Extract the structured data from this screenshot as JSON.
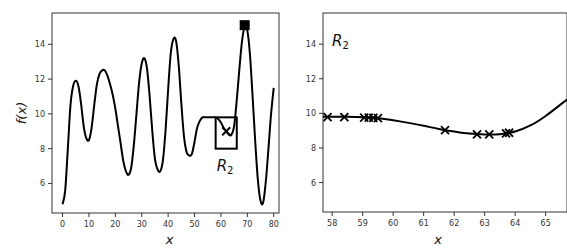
{
  "chart_data": [
    {
      "type": "line",
      "title": "",
      "xlabel": "x",
      "ylabel": "f(x)",
      "xlim": [
        -4,
        82
      ],
      "ylim": [
        4.3,
        15.8
      ],
      "xticks": [
        0,
        10,
        20,
        30,
        40,
        50,
        60,
        70,
        80
      ],
      "yticks": [
        6,
        8,
        10,
        12,
        14
      ],
      "grid": false,
      "series": [
        {
          "name": "f(x)",
          "x": [
            0,
            1,
            2,
            3,
            4,
            5,
            6,
            7,
            8,
            9,
            10,
            11,
            12,
            13,
            14,
            15,
            16,
            17,
            18,
            19,
            20,
            21,
            22,
            23,
            24,
            25,
            26,
            27,
            28,
            29,
            30,
            31,
            32,
            33,
            34,
            35,
            36,
            37,
            38,
            39,
            40,
            41,
            42,
            43,
            44,
            45,
            46,
            47,
            48,
            49,
            50,
            51,
            52,
            53,
            54,
            55,
            56,
            57,
            58,
            59,
            60,
            61,
            62,
            63,
            64,
            65,
            66,
            67,
            68,
            69,
            70,
            71,
            72,
            73,
            74,
            75,
            76,
            77,
            78,
            79,
            80
          ],
          "y": [
            4.8,
            5.6,
            8.0,
            10.5,
            11.6,
            11.9,
            11.6,
            10.6,
            9.3,
            8.6,
            8.5,
            9.2,
            10.5,
            11.7,
            12.3,
            12.5,
            12.5,
            12.2,
            11.7,
            11.1,
            10.3,
            9.3,
            8.3,
            7.3,
            6.7,
            6.5,
            6.9,
            8.2,
            10.0,
            11.8,
            12.9,
            13.2,
            12.6,
            11.0,
            9.0,
            7.4,
            6.8,
            6.7,
            7.3,
            9.0,
            11.4,
            13.5,
            14.3,
            14.2,
            12.8,
            10.6,
            8.7,
            7.8,
            7.6,
            7.7,
            8.4,
            9.2,
            9.6,
            9.8,
            9.8,
            9.8,
            9.8,
            9.8,
            9.8,
            9.7,
            9.5,
            9.2,
            9.0,
            8.8,
            8.8,
            9.3,
            10.8,
            12.6,
            14.2,
            15.0,
            14.8,
            13.4,
            11.0,
            8.4,
            6.2,
            5.0,
            4.9,
            6.1,
            8.0,
            10.0,
            11.5
          ]
        }
      ],
      "annotations": [
        {
          "type": "square-marker",
          "x": 69,
          "y": 15.1,
          "label": "maximum"
        },
        {
          "type": "x-marker",
          "x": 62,
          "y": 9.0
        },
        {
          "type": "rectangle",
          "x_range": [
            58,
            66
          ],
          "y_range": [
            8.0,
            9.8
          ],
          "label": "R2"
        }
      ]
    },
    {
      "type": "line",
      "title": "",
      "xlabel": "x",
      "ylabel": "",
      "xlim": [
        57.7,
        65.7
      ],
      "ylim": [
        4.3,
        15.8
      ],
      "xticks": [
        58,
        59,
        60,
        61,
        62,
        63,
        64,
        65
      ],
      "yticks": [
        6,
        8,
        10,
        12,
        14
      ],
      "grid": false,
      "region_label": "R2",
      "series": [
        {
          "name": "f(x)",
          "x": [
            57.7,
            58.0,
            58.5,
            59.0,
            59.5,
            60.0,
            60.5,
            61.0,
            61.5,
            62.0,
            62.5,
            63.0,
            63.5,
            64.0,
            64.5,
            65.0,
            65.7
          ],
          "y": [
            9.8,
            9.8,
            9.8,
            9.78,
            9.72,
            9.6,
            9.45,
            9.28,
            9.1,
            8.95,
            8.83,
            8.78,
            8.8,
            8.95,
            9.3,
            9.85,
            10.8
          ]
        },
        {
          "name": "samples",
          "marker": "x",
          "x": [
            57.85,
            58.4,
            59.05,
            59.2,
            59.35,
            59.5,
            61.7,
            62.75,
            63.15,
            63.7,
            63.8
          ],
          "y": [
            9.78,
            9.78,
            9.76,
            9.75,
            9.74,
            9.72,
            9.03,
            8.78,
            8.78,
            8.85,
            8.88
          ]
        }
      ]
    }
  ]
}
